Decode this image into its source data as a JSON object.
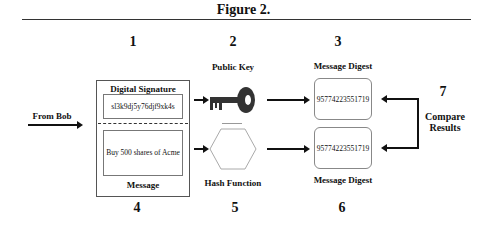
{
  "figure": {
    "title": "Figure 2.",
    "steps": {
      "n1": "1",
      "n2": "2",
      "n3": "3",
      "n4": "4",
      "n5": "5",
      "n6": "6",
      "n7": "7"
    },
    "from_label": "From Bob",
    "signature_box": {
      "header": "Digital Signature",
      "value": "sl3k9dj5y76djf9xk4s"
    },
    "message_box": {
      "value": "Buy 500 shares of Acme",
      "footer": "Message"
    },
    "public_key": {
      "label": "Public Key",
      "icon": "key-icon"
    },
    "hash_function": {
      "label": "Hash Function",
      "icon": "hexagon-icon"
    },
    "digest_top": {
      "label": "Message Digest",
      "value": "95774223551719"
    },
    "digest_bottom": {
      "label": "Message Digest",
      "value": "95774223551719"
    },
    "compare": {
      "line1": "Compare",
      "line2": "Results"
    }
  }
}
